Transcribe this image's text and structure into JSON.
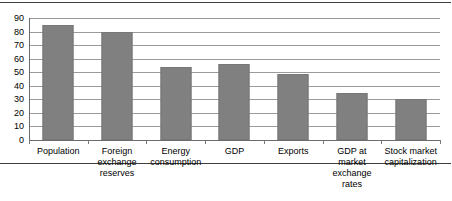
{
  "chart_data": {
    "type": "bar",
    "title": "",
    "xlabel": "",
    "ylabel": "",
    "ylim": [
      0,
      90
    ],
    "ytick_step": 10,
    "yticks": [
      90,
      80,
      70,
      60,
      50,
      40,
      30,
      20,
      10,
      0
    ],
    "grid": true,
    "legend": "none",
    "bar_color": "#808080",
    "gridline_color": "#9a9a9a",
    "axis_color": "#6b6b6b",
    "categories": [
      "Population",
      "Foreign exchange reserves",
      "Energy consumption",
      "GDP",
      "Exports",
      "GDP at market exchange rates",
      "Stock market capitalization"
    ],
    "category_lines": [
      [
        "Population"
      ],
      [
        "Foreign",
        "exchange",
        "reserves"
      ],
      [
        "Energy",
        "consumption"
      ],
      [
        "GDP"
      ],
      [
        "Exports"
      ],
      [
        "GDP at market",
        "exchange",
        "rates"
      ],
      [
        "Stock market",
        "capitalization"
      ]
    ],
    "values": [
      85,
      80,
      54,
      56,
      49,
      35,
      30
    ]
  }
}
